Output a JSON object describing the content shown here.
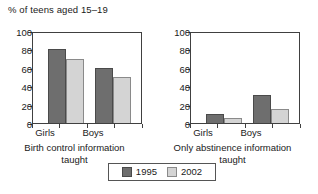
{
  "chart_data": {
    "type": "bar",
    "title": "% of teens aged 15–19",
    "xlabel": "",
    "ylabel": "",
    "ylim": [
      0,
      100
    ],
    "yticks": [
      0,
      20,
      40,
      60,
      80,
      100
    ],
    "ytick_labels": [
      "0",
      "20",
      "40",
      "60",
      "80",
      "100"
    ],
    "grid": false,
    "legend_position": "bottom-center",
    "categories": [
      "Girls",
      "Boys"
    ],
    "series": [
      {
        "name": "1995",
        "color": "#6e6e6e"
      },
      {
        "name": "2002",
        "color": "#d4d4d4"
      }
    ],
    "panels": [
      {
        "caption": "Birth control information taught",
        "caption_line1": "Birth control information",
        "caption_line2": "taught",
        "categories": [
          "Girls",
          "Boys"
        ],
        "series": [
          {
            "name": "1995",
            "values": [
              80,
              60
            ]
          },
          {
            "name": "2002",
            "values": [
              70,
              50
            ]
          }
        ]
      },
      {
        "caption": "Only abstinence information taught",
        "caption_line1": "Only abstinence information",
        "caption_line2": "taught",
        "categories": [
          "Girls",
          "Boys"
        ],
        "series": [
          {
            "name": "1995",
            "values": [
              10,
              30
            ]
          },
          {
            "name": "2002",
            "values": [
              5,
              15
            ]
          }
        ]
      }
    ]
  },
  "legend": {
    "entries": [
      {
        "label": "1995",
        "color": "#6e6e6e"
      },
      {
        "label": "2002",
        "color": "#d4d4d4"
      }
    ]
  }
}
